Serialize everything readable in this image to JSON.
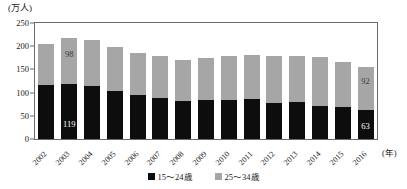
{
  "chart_data": {
    "type": "bar",
    "stacked": true,
    "title": "",
    "subtitle": "",
    "xlabel": "(年)",
    "ylabel": "(万人)",
    "ylim": [
      0,
      250
    ],
    "ytick_labels": [
      "250",
      "200",
      "150",
      "100",
      "50",
      "0"
    ],
    "ytick_values": [
      250,
      200,
      150,
      100,
      50,
      0
    ],
    "grid": false,
    "legend_position": "bottom",
    "categories": [
      "2002",
      "2003",
      "2004",
      "2005",
      "2006",
      "2007",
      "2008",
      "2009",
      "2010",
      "2011",
      "2012",
      "2013",
      "2014",
      "2015",
      "2016"
    ],
    "series": [
      {
        "name": "15～24歳",
        "color": "#0d0d0d",
        "values": [
          116,
          119,
          114,
          103,
          95,
          89,
          82,
          85,
          84,
          86,
          77,
          80,
          72,
          69,
          63
        ]
      },
      {
        "name": "25～34歳",
        "color": "#a6a6a6",
        "values": [
          89,
          98,
          99,
          96,
          90,
          91,
          88,
          90,
          96,
          96,
          101,
          99,
          105,
          96,
          92
        ]
      }
    ],
    "totals": [
      205,
      217,
      213,
      199,
      185,
      180,
      170,
      175,
      180,
      182,
      178,
      179,
      177,
      165,
      155
    ],
    "annotations": [
      {
        "category": "2003",
        "series": "25～34歳",
        "value": "98"
      },
      {
        "category": "2003",
        "series": "15～24歳",
        "value": "119"
      },
      {
        "category": "2016",
        "series": "25～34歳",
        "value": "92"
      },
      {
        "category": "2016",
        "series": "15～24歳",
        "value": "63"
      }
    ]
  },
  "legend": {
    "items": [
      {
        "label": "15～24歳",
        "swatch": "black-square-icon"
      },
      {
        "label": "25～34歳",
        "swatch": "gray-square-icon"
      }
    ]
  },
  "axis": {
    "y_unit": "(万人)",
    "x_unit": "(年)"
  }
}
